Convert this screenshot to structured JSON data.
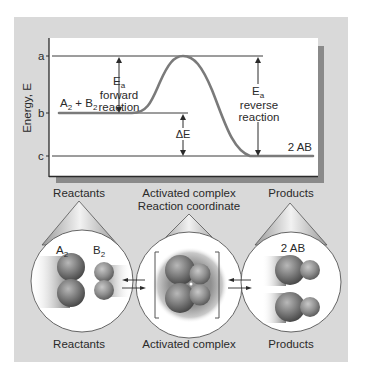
{
  "colors": {
    "background": "#ffffff",
    "panel_bg": "#d9d9d9",
    "plot_bg": "#ffffff",
    "shadow": "#8a8a8a",
    "line": "#3a3a3a",
    "curve": "#7a7a7a",
    "text": "#2a2a2a"
  },
  "energy_diagram": {
    "y_axis_label": "Energy, E",
    "levels": {
      "a": "a",
      "b": "b",
      "c": "c"
    },
    "reactants_label": "A",
    "reactants_sub1": "2",
    "reactants_plus": " + B",
    "reactants_sub2": "2",
    "products_label": "2 AB",
    "ea_forward": {
      "symbol": "E",
      "sub": "a",
      "line1": "forward",
      "line2": "reaction"
    },
    "ea_reverse": {
      "symbol": "E",
      "sub": "a",
      "line1": "reverse",
      "line2": "reaction"
    },
    "delta_e": "ΔE"
  },
  "molecular_views": {
    "reactants": {
      "top_label": "Reactants",
      "bottom_label": "Reactants",
      "molecule_a": "A",
      "molecule_a_sub": "2",
      "molecule_b": "B",
      "molecule_b_sub": "2"
    },
    "activated_complex": {
      "top_label_line1": "Activated complex",
      "top_label_line2": "Reaction coordinate",
      "bottom_label": "Activated complex"
    },
    "products": {
      "top_label": "Products",
      "bottom_label": "Products",
      "molecule_label": "2 AB"
    }
  }
}
